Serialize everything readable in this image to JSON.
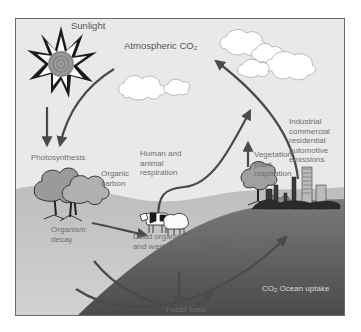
{
  "diagram": {
    "labels": {
      "sunlight": "Sunlight",
      "atmospheric_co2": "Atmospheric CO",
      "atmospheric_co2_sub": "2",
      "photosynthesis": "Photosynthesis",
      "organic_carbon_1": "Organic",
      "organic_carbon_2": "carbon",
      "human_animal_resp_1": "Human and",
      "human_animal_resp_2": "animal",
      "human_animal_resp_3": "respiration",
      "vegetation_resp_1": "Vegetation",
      "vegetation_resp_2": "plant",
      "vegetation_resp_3": "respiration",
      "emissions_1": "Industrial",
      "emissions_2": "commercial",
      "emissions_3": "residential",
      "emissions_4": "automotive",
      "emissions_5": "emissions",
      "organism_decay_1": "Organism",
      "organism_decay_2": "decay",
      "dead_organisms_1": "Dead organisms",
      "dead_organisms_2": "and waste products",
      "root_resp_1": "Root",
      "root_resp_2": "respiration",
      "human_uses": "Human uses",
      "ocean_uptake_co": "CO",
      "ocean_uptake_sub": "2",
      "ocean_uptake_rest": " Ocean uptake",
      "fossil_fuels": "Fossil fuels"
    },
    "icons": [
      "sun-icon",
      "cloud-icon",
      "tree-icon",
      "cow-icon",
      "sheep-icon",
      "city-skyline-icon",
      "ocean-icon"
    ],
    "colors": {
      "background": "#e9e9e9",
      "ground": "#c4c4c4",
      "ocean": "#5e5e5e",
      "arrow": "#4a4a4a",
      "label": "#6f6f6f"
    }
  }
}
